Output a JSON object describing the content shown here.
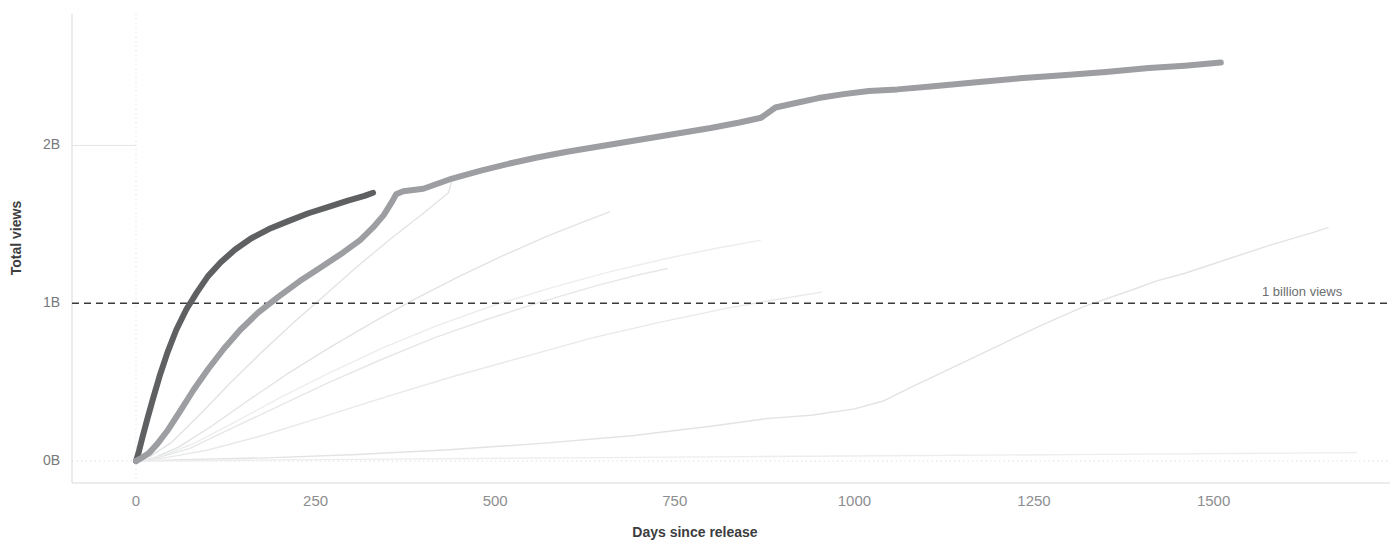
{
  "chart_data": {
    "type": "line",
    "title": "",
    "xlabel": "Days since release",
    "ylabel": "Total views",
    "xlim": [
      -90,
      1700
    ],
    "ylim": [
      -0.12,
      2.62
    ],
    "xticks": [
      0,
      250,
      500,
      750,
      1000,
      1250,
      1500
    ],
    "xticklabels": [
      "0",
      "250",
      "500",
      "750",
      "1000",
      "1250",
      "1500"
    ],
    "yticks": [
      0,
      1,
      2
    ],
    "yticklabels": [
      "0B",
      "1B",
      "2B"
    ],
    "grid": "dotted light horizontal and vertical at 0",
    "legend": "none",
    "units": "billions of views",
    "annotations": [
      {
        "text": "1 billion views",
        "y": 1,
        "x": 1700,
        "style": "dashed horizontal reference line with right-aligned label"
      }
    ],
    "reference_lines": [
      {
        "label": "1 billion views",
        "value": 1,
        "orientation": "horizontal",
        "dash": "dashed",
        "color": "#3a3a3c"
      }
    ],
    "colors": {
      "highlight_dark": "#5f6062",
      "highlight_mid": "#9d9ea1",
      "background_faint": "#e2e3e5",
      "background_faintest": "#eceded",
      "axis": "#d8d9db",
      "text": "#77787b",
      "text_bold": "#3d3d3f"
    },
    "series": [
      {
        "name": "highlighted-dark-fastest",
        "emphasis": "high",
        "color": "#5f6062",
        "width": 6,
        "points": [
          [
            0,
            0.0
          ],
          [
            4,
            0.06
          ],
          [
            9,
            0.15
          ],
          [
            16,
            0.27
          ],
          [
            24,
            0.4
          ],
          [
            33,
            0.54
          ],
          [
            44,
            0.69
          ],
          [
            56,
            0.83
          ],
          [
            70,
            0.96
          ],
          [
            85,
            1.07
          ],
          [
            100,
            1.17
          ],
          [
            118,
            1.26
          ],
          [
            138,
            1.34
          ],
          [
            160,
            1.41
          ],
          [
            185,
            1.47
          ],
          [
            212,
            1.52
          ],
          [
            240,
            1.57
          ],
          [
            268,
            1.61
          ],
          [
            295,
            1.65
          ],
          [
            318,
            1.68
          ],
          [
            330,
            1.7
          ]
        ]
      },
      {
        "name": "highlighted-mid-longrun",
        "emphasis": "high",
        "color": "#9d9ea1",
        "width": 6,
        "points": [
          [
            0,
            0.0
          ],
          [
            8,
            0.02
          ],
          [
            18,
            0.05
          ],
          [
            30,
            0.11
          ],
          [
            45,
            0.2
          ],
          [
            62,
            0.32
          ],
          [
            80,
            0.45
          ],
          [
            100,
            0.58
          ],
          [
            122,
            0.71
          ],
          [
            145,
            0.83
          ],
          [
            170,
            0.94
          ],
          [
            198,
            1.04
          ],
          [
            228,
            1.14
          ],
          [
            258,
            1.23
          ],
          [
            288,
            1.32
          ],
          [
            312,
            1.4
          ],
          [
            330,
            1.48
          ],
          [
            345,
            1.56
          ],
          [
            356,
            1.64
          ],
          [
            362,
            1.69
          ],
          [
            372,
            1.71
          ],
          [
            400,
            1.725
          ],
          [
            440,
            1.79
          ],
          [
            480,
            1.84
          ],
          [
            520,
            1.885
          ],
          [
            560,
            1.925
          ],
          [
            600,
            1.96
          ],
          [
            640,
            1.99
          ],
          [
            680,
            2.02
          ],
          [
            720,
            2.05
          ],
          [
            760,
            2.08
          ],
          [
            800,
            2.11
          ],
          [
            840,
            2.145
          ],
          [
            870,
            2.175
          ],
          [
            890,
            2.24
          ],
          [
            920,
            2.27
          ],
          [
            950,
            2.3
          ],
          [
            985,
            2.325
          ],
          [
            1020,
            2.345
          ],
          [
            1060,
            2.355
          ],
          [
            1110,
            2.375
          ],
          [
            1170,
            2.4
          ],
          [
            1230,
            2.425
          ],
          [
            1290,
            2.445
          ],
          [
            1350,
            2.465
          ],
          [
            1410,
            2.49
          ],
          [
            1460,
            2.505
          ],
          [
            1510,
            2.525
          ]
        ]
      },
      {
        "name": "faint-a",
        "emphasis": "low",
        "color": "#e2e3e5",
        "width": 1.4,
        "points": [
          [
            0,
            0.0
          ],
          [
            20,
            0.03
          ],
          [
            50,
            0.12
          ],
          [
            90,
            0.3
          ],
          [
            130,
            0.49
          ],
          [
            175,
            0.69
          ],
          [
            220,
            0.88
          ],
          [
            265,
            1.06
          ],
          [
            310,
            1.24
          ],
          [
            355,
            1.41
          ],
          [
            400,
            1.57
          ],
          [
            435,
            1.7
          ],
          [
            440,
            1.78
          ]
        ]
      },
      {
        "name": "faint-b",
        "emphasis": "low",
        "color": "#e2e3e5",
        "width": 1.4,
        "points": [
          [
            0,
            0.0
          ],
          [
            25,
            0.02
          ],
          [
            60,
            0.09
          ],
          [
            105,
            0.22
          ],
          [
            155,
            0.38
          ],
          [
            210,
            0.55
          ],
          [
            270,
            0.72
          ],
          [
            330,
            0.88
          ],
          [
            390,
            1.03
          ],
          [
            450,
            1.17
          ],
          [
            510,
            1.3
          ],
          [
            570,
            1.42
          ],
          [
            620,
            1.51
          ],
          [
            660,
            1.58
          ]
        ]
      },
      {
        "name": "faint-c",
        "emphasis": "low",
        "color": "#e6e7e9",
        "width": 1.4,
        "points": [
          [
            0,
            0.0
          ],
          [
            30,
            0.02
          ],
          [
            75,
            0.08
          ],
          [
            130,
            0.2
          ],
          [
            195,
            0.34
          ],
          [
            265,
            0.49
          ],
          [
            340,
            0.64
          ],
          [
            415,
            0.78
          ],
          [
            490,
            0.9
          ],
          [
            565,
            1.01
          ],
          [
            640,
            1.11
          ],
          [
            700,
            1.18
          ],
          [
            740,
            1.22
          ]
        ]
      },
      {
        "name": "faint-d",
        "emphasis": "low",
        "color": "#e8e9ea",
        "width": 1.4,
        "points": [
          [
            0,
            0.0
          ],
          [
            40,
            0.02
          ],
          [
            100,
            0.07
          ],
          [
            175,
            0.16
          ],
          [
            260,
            0.28
          ],
          [
            350,
            0.41
          ],
          [
            445,
            0.54
          ],
          [
            540,
            0.66
          ],
          [
            635,
            0.78
          ],
          [
            730,
            0.88
          ],
          [
            825,
            0.97
          ],
          [
            900,
            1.03
          ],
          [
            955,
            1.07
          ]
        ]
      },
      {
        "name": "faint-e",
        "emphasis": "low",
        "color": "#eceded",
        "width": 1.4,
        "points": [
          [
            0,
            0.0
          ],
          [
            35,
            0.03
          ],
          [
            80,
            0.11
          ],
          [
            135,
            0.24
          ],
          [
            200,
            0.4
          ],
          [
            270,
            0.56
          ],
          [
            345,
            0.72
          ],
          [
            420,
            0.86
          ],
          [
            500,
            0.99
          ],
          [
            580,
            1.1
          ],
          [
            660,
            1.2
          ],
          [
            740,
            1.285
          ],
          [
            810,
            1.35
          ],
          [
            870,
            1.4
          ]
        ]
      },
      {
        "name": "faint-slow-sleeper",
        "emphasis": "low",
        "color": "#e2e3e5",
        "width": 1.4,
        "points": [
          [
            0,
            0.0
          ],
          [
            80,
            0.01
          ],
          [
            180,
            0.02
          ],
          [
            300,
            0.04
          ],
          [
            430,
            0.07
          ],
          [
            560,
            0.11
          ],
          [
            690,
            0.16
          ],
          [
            800,
            0.22
          ],
          [
            880,
            0.27
          ],
          [
            940,
            0.29
          ],
          [
            1000,
            0.33
          ],
          [
            1040,
            0.38
          ],
          [
            1080,
            0.47
          ],
          [
            1140,
            0.6
          ],
          [
            1200,
            0.73
          ],
          [
            1260,
            0.86
          ],
          [
            1320,
            0.98
          ],
          [
            1390,
            1.09
          ],
          [
            1420,
            1.14
          ],
          [
            1460,
            1.19
          ],
          [
            1520,
            1.28
          ],
          [
            1580,
            1.37
          ],
          [
            1640,
            1.45
          ],
          [
            1660,
            1.48
          ]
        ]
      },
      {
        "name": "faint-flat-bottom",
        "emphasis": "low",
        "color": "#ededee",
        "width": 1.4,
        "points": [
          [
            0,
            0.0
          ],
          [
            150,
            0.005
          ],
          [
            350,
            0.012
          ],
          [
            600,
            0.02
          ],
          [
            850,
            0.028
          ],
          [
            1100,
            0.035
          ],
          [
            1350,
            0.042
          ],
          [
            1600,
            0.05
          ],
          [
            1700,
            0.053
          ]
        ]
      }
    ]
  }
}
